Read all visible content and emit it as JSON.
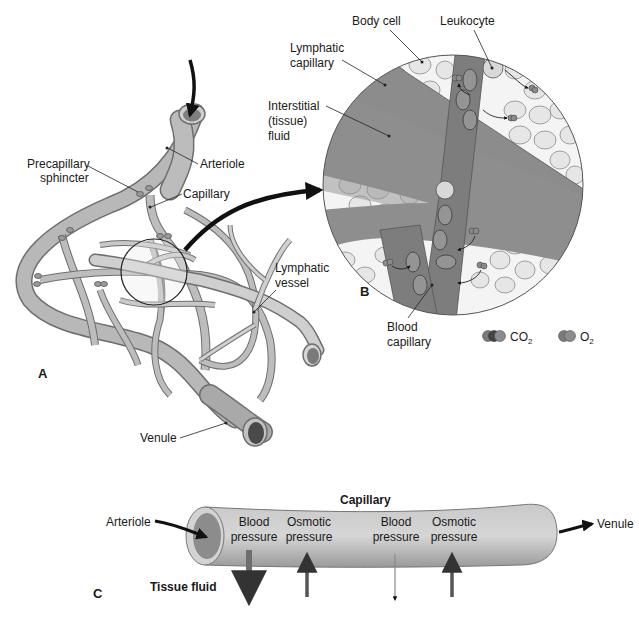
{
  "figure": {
    "panels": {
      "a": "A",
      "b": "B",
      "c": "C"
    },
    "panel_a": {
      "labels": {
        "precapillary_line1": "Precapillary",
        "precapillary_line2": "sphincter",
        "arteriole": "Arteriole",
        "capillary": "Capillary",
        "lymphatic_vessel_line1": "Lymphatic",
        "lymphatic_vessel_line2": "vessel",
        "venule": "Venule"
      }
    },
    "panel_b": {
      "labels": {
        "body_cell": "Body cell",
        "leukocyte": "Leukocyte",
        "lymphatic_capillary_line1": "Lymphatic",
        "lymphatic_capillary_line2": "capillary",
        "interstitial_line1": "Interstitial",
        "interstitial_line2": "(tissue)",
        "interstitial_line3": "fluid",
        "blood_capillary_line1": "Blood",
        "blood_capillary_line2": "capillary"
      },
      "legend": [
        {
          "symbol": "co2-molecule",
          "label": "CO",
          "subscript": "2"
        },
        {
          "symbol": "o2-molecule",
          "label": "O",
          "subscript": "2"
        }
      ]
    },
    "panel_c": {
      "title": "Capillary",
      "inflow_label": "Arteriole",
      "outflow_label": "Venule",
      "tissue_fluid_label": "Tissue fluid",
      "forces": [
        {
          "line1": "Blood",
          "line2": "pressure",
          "direction": "out",
          "strength": "strong"
        },
        {
          "line1": "Osmotic",
          "line2": "pressure",
          "direction": "in",
          "strength": "strong"
        },
        {
          "line1": "Blood",
          "line2": "pressure",
          "direction": "out",
          "strength": "weak"
        },
        {
          "line1": "Osmotic",
          "line2": "pressure",
          "direction": "in",
          "strength": "strong"
        }
      ]
    },
    "colors": {
      "vessel_fill": "#b8b8b8",
      "vessel_stroke": "#6e6e6e",
      "lumen_dark": "#6a6a6a",
      "fluid_gray": "#8c8c8c",
      "cell_fill": "#e8e8e8",
      "cell_nucleus": "#c4c4c4",
      "arrow_black": "#111111"
    }
  }
}
